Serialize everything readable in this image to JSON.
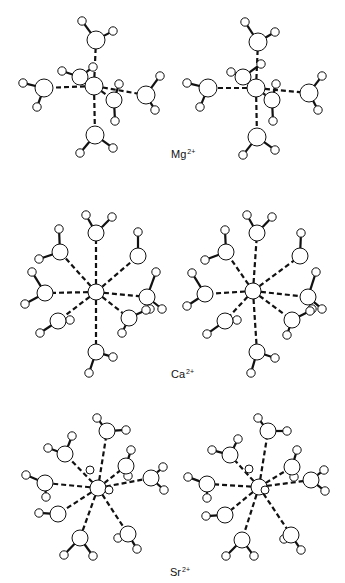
{
  "figure": {
    "stroke": "#111111",
    "fill": "#ffffff",
    "bond_width": 2.2,
    "coord_dash": "5,3",
    "coord_width": 2.2
  },
  "panels": [
    {
      "ion": "Mg",
      "charge": "2+",
      "label_pos": [
        171,
        148
      ],
      "views": [
        {
          "center": [
            94,
            86
          ],
          "ion_r": 9,
          "waters": [
            {
              "o": [
                80,
                77
              ],
              "r": 8,
              "h": [
                [
                  62,
                  71
                ],
                [
                  93,
                  67
                ]
              ],
              "back": true
            },
            {
              "o": [
                96,
                40
              ],
              "r": 9,
              "h": [
                [
                  82,
                  21
                ],
                [
                  113,
                  31
                ]
              ]
            },
            {
              "o": [
                44,
                88
              ],
              "r": 9,
              "h": [
                [
                  23,
                  83
                ],
                [
                  37,
                  107
                ]
              ]
            },
            {
              "o": [
                146,
                95
              ],
              "r": 9,
              "h": [
                [
                  160,
                  76
                ],
                [
                  155,
                  110
                ]
              ]
            },
            {
              "o": [
                95,
                135
              ],
              "r": 9,
              "h": [
                [
                  80,
                  153
                ],
                [
                  113,
                  148
                ]
              ]
            },
            {
              "o": [
                114,
                100
              ],
              "r": 8,
              "h": [
                [
                  119,
                  84
                ],
                [
                  115,
                  121
                ]
              ],
              "front": true
            }
          ]
        },
        {
          "center": [
            256,
            88
          ],
          "ion_r": 9,
          "waters": [
            {
              "o": [
                243,
                77
              ],
              "r": 8,
              "h": [
                [
                  231,
                  72
                ],
                [
                  261,
                  64
                ]
              ],
              "back": true
            },
            {
              "o": [
                258,
                42
              ],
              "r": 9,
              "h": [
                [
                  245,
                  22
                ],
                [
                  275,
                  32
                ]
              ]
            },
            {
              "o": [
                208,
                88
              ],
              "r": 9,
              "h": [
                [
                  187,
                  83
                ],
                [
                  200,
                  107
                ]
              ]
            },
            {
              "o": [
                309,
                93
              ],
              "r": 9,
              "h": [
                [
                  322,
                  76
                ],
                [
                  318,
                  110
                ]
              ]
            },
            {
              "o": [
                257,
                137
              ],
              "r": 9,
              "h": [
                [
                  243,
                  155
                ],
                [
                  275,
                  150
                ]
              ]
            },
            {
              "o": [
                272,
                100
              ],
              "r": 8,
              "h": [
                [
                  276,
                  84
                ],
                [
                  273,
                  121
                ]
              ],
              "front": true
            }
          ]
        }
      ]
    },
    {
      "ion": "Ca",
      "charge": "2+",
      "label_pos": [
        171,
        368
      ],
      "views": [
        {
          "center": [
            96,
            292
          ],
          "ion_r": 8,
          "waters": [
            {
              "o": [
                96,
                233
              ],
              "r": 8,
              "h": [
                [
                  86,
                  215
                ],
                [
                  112,
                  217
                ]
              ]
            },
            {
              "o": [
                60,
                252
              ],
              "r": 8,
              "h": [
                [
                  59,
                  229
                ],
                [
                  39,
                  259
                ]
              ]
            },
            {
              "o": [
                138,
                256
              ],
              "r": 8,
              "h": [
                [
                  138,
                  232
                ]
              ]
            },
            {
              "o": [
                45,
                293
              ],
              "r": 8,
              "h": [
                [
                  32,
                  272
                ],
                [
                  25,
                  304
                ]
              ]
            },
            {
              "o": [
                147,
                297
              ],
              "r": 8,
              "h": [
                [
                  156,
                  272
                ],
                [
                  162,
                  309
                ],
                [
                  150,
                  309
                ]
              ]
            },
            {
              "o": [
                58,
                321
              ],
              "r": 8,
              "h": [
                [
                  40,
                  333
                ],
                [
                  70,
                  320
                ]
              ]
            },
            {
              "o": [
                129,
                318
              ],
              "r": 8,
              "h": [
                [
                  122,
                  333
                ],
                [
                  146,
                  310
                ]
              ]
            },
            {
              "o": [
                96,
                352
              ],
              "r": 8,
              "h": [
                [
                  89,
                  373
                ],
                [
                  113,
                  357
                ]
              ]
            }
          ]
        },
        {
          "center": [
            253,
            291
          ],
          "ion_r": 8,
          "waters": [
            {
              "o": [
                257,
                233
              ],
              "r": 8,
              "h": [
                [
                  247,
                  215
                ],
                [
                  272,
                  217
                ]
              ]
            },
            {
              "o": [
                226,
                252
              ],
              "r": 8,
              "h": [
                [
                  225,
                  230
                ],
                [
                  205,
                  260
                ]
              ]
            },
            {
              "o": [
                300,
                256
              ],
              "r": 8,
              "h": [
                [
                  301,
                  233
                ]
              ]
            },
            {
              "o": [
                205,
                294
              ],
              "r": 8,
              "h": [
                [
                  192,
                  273
                ],
                [
                  187,
                  306
                ]
              ]
            },
            {
              "o": [
                308,
                297
              ],
              "r": 8,
              "h": [
                [
                  316,
                  272
                ],
                [
                  322,
                  309
                ],
                [
                  312,
                  309
                ]
              ]
            },
            {
              "o": [
                225,
                321
              ],
              "r": 8,
              "h": [
                [
                  207,
                  334
                ],
                [
                  237,
                  320
                ]
              ]
            },
            {
              "o": [
                292,
                320
              ],
              "r": 8,
              "h": [
                [
                  287,
                  335
                ],
                [
                  310,
                  311
                ]
              ]
            },
            {
              "o": [
                257,
                352
              ],
              "r": 8,
              "h": [
                [
                  251,
                  373
                ],
                [
                  275,
                  358
                ]
              ]
            }
          ]
        }
      ]
    },
    {
      "ion": "Sr",
      "charge": "2+",
      "label_pos": [
        170,
        568
      ],
      "views": [
        {
          "center": [
            98,
            488
          ],
          "ion_r": 8,
          "waters": [
            {
              "o": [
                90,
                470
              ],
              "r": 4,
              "h": [],
              "front": true
            },
            {
              "o": [
                107,
                431
              ],
              "r": 8,
              "h": [
                [
                  97,
                  418
                ],
                [
                  126,
                  430
                ]
              ]
            },
            {
              "o": [
                65,
                454
              ],
              "r": 8,
              "h": [
                [
                  48,
                  448
                ],
                [
                  72,
                  436
                ]
              ]
            },
            {
              "o": [
                126,
                466
              ],
              "r": 8,
              "h": [
                [
                  131,
                  450
                ],
                [
                  128,
                  476
                ]
              ]
            },
            {
              "o": [
                45,
                483
              ],
              "r": 8,
              "h": [
                [
                  26,
                  475
                ],
                [
                  46,
                  497
                ]
              ]
            },
            {
              "o": [
                151,
                478
              ],
              "r": 8,
              "h": [
                [
                  163,
                  467
                ],
                [
                  164,
                  490
                ]
              ]
            },
            {
              "o": [
                58,
                514
              ],
              "r": 8,
              "h": [
                [
                  39,
                  513
                ]
              ]
            },
            {
              "o": [
                128,
                534
              ],
              "r": 8,
              "h": [
                [
                  118,
                  538
                ],
                [
                  137,
                  549
                ]
              ]
            },
            {
              "o": [
                80,
                538
              ],
              "r": 8,
              "h": [
                [
                  64,
                  555
                ],
                [
                  93,
                  556
                ]
              ]
            },
            {
              "o": [
                109,
                490
              ],
              "r": 4,
              "h": [],
              "front": true
            }
          ]
        },
        {
          "center": [
            259,
            487
          ],
          "ion_r": 8,
          "waters": [
            {
              "o": [
                249,
                469
              ],
              "r": 4,
              "h": [],
              "front": true
            },
            {
              "o": [
                268,
                431
              ],
              "r": 8,
              "h": [
                [
                  258,
                  418
                ],
                [
                  287,
                  431
                ]
              ]
            },
            {
              "o": [
                230,
                455
              ],
              "r": 8,
              "h": [
                [
                  212,
                  450
                ],
                [
                  238,
                  439
                ]
              ]
            },
            {
              "o": [
                292,
                467
              ],
              "r": 8,
              "h": [
                [
                  297,
                  450
                ],
                [
                  294,
                  477
                ]
              ]
            },
            {
              "o": [
                207,
                484
              ],
              "r": 8,
              "h": [
                [
                  188,
                  477
                ],
                [
                  207,
                  498
                ]
              ]
            },
            {
              "o": [
                311,
                480
              ],
              "r": 8,
              "h": [
                [
                  324,
                  470
                ],
                [
                  325,
                  491
                ]
              ]
            },
            {
              "o": [
                225,
                515
              ],
              "r": 8,
              "h": [
                [
                  206,
                  516
                ]
              ]
            },
            {
              "o": [
                291,
                535
              ],
              "r": 8,
              "h": [
                [
                  284,
                  539
                ],
                [
                  301,
                  550
                ]
              ]
            },
            {
              "o": [
                242,
                540
              ],
              "r": 8,
              "h": [
                [
                  226,
                  556
                ],
                [
                  254,
                  556
                ]
              ]
            },
            {
              "o": [
                265,
                490
              ],
              "r": 4,
              "h": [],
              "front": true
            }
          ]
        }
      ]
    }
  ]
}
